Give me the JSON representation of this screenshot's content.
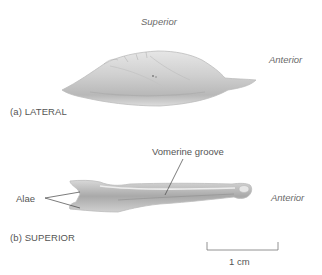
{
  "figure": {
    "panel_a": {
      "caption": "(a) LATERAL",
      "orientation_top": "Superior",
      "orientation_right": "Anterior"
    },
    "panel_b": {
      "caption": "(b) SUPERIOR",
      "orientation_right": "Anterior",
      "callouts": {
        "vomerine_groove": "Vomerine groove",
        "alae": "Alae"
      }
    },
    "scale_bar": {
      "label": "1 cm"
    }
  }
}
